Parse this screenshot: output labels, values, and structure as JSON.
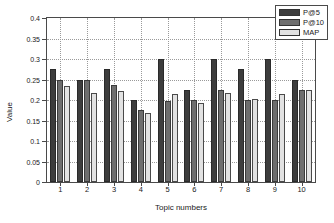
{
  "chart_data": {
    "type": "bar",
    "title": "",
    "xlabel": "Topic numbers",
    "ylabel": "Value",
    "categories": [
      "1",
      "2",
      "3",
      "4",
      "5",
      "6",
      "7",
      "8",
      "9",
      "10"
    ],
    "series": [
      {
        "name": "P@5",
        "color": "#3d3d3d",
        "values": [
          0.275,
          0.249,
          0.275,
          0.199,
          0.299,
          0.225,
          0.299,
          0.275,
          0.299,
          0.249
        ]
      },
      {
        "name": "P@10",
        "color": "#6e6e6e",
        "values": [
          0.249,
          0.249,
          0.237,
          0.175,
          0.198,
          0.199,
          0.224,
          0.199,
          0.199,
          0.224
        ]
      },
      {
        "name": "MAP",
        "color": "#e2e2e2",
        "values": [
          0.233,
          0.218,
          0.221,
          0.169,
          0.214,
          0.192,
          0.218,
          0.202,
          0.214,
          0.224
        ]
      }
    ],
    "ylim": [
      0,
      0.4
    ],
    "yticks": [
      "0",
      "0.05",
      "0.1",
      "0.15",
      "0.2",
      "0.25",
      "0.3",
      "0.35",
      "0.4"
    ],
    "ytick_values": [
      0,
      0.05,
      0.1,
      0.15,
      0.2,
      0.25,
      0.3,
      0.35,
      0.4
    ],
    "grid": true,
    "legend_position": "upper-right",
    "legend": [
      "P@5",
      "P@10",
      "MAP"
    ]
  }
}
